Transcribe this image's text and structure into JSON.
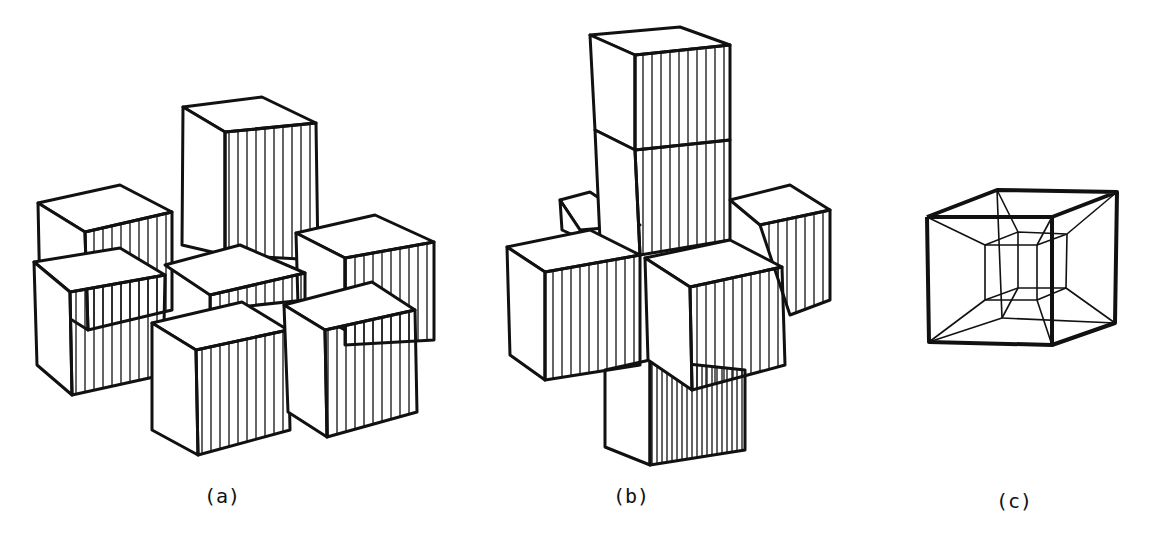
{
  "figures": [
    {
      "id": "a",
      "label": "(a)",
      "description": "arrangement of seven cubes: central cube with six neighbors around it"
    },
    {
      "id": "b",
      "label": "(b)",
      "description": "3D cross of cubes (unfolded tesseract / Dali cross style)"
    },
    {
      "id": "c",
      "label": "(c)",
      "description": "tesseract wireframe: cube within a cube"
    }
  ],
  "colors": {
    "ink": "#111111",
    "paper": "#ffffff"
  }
}
